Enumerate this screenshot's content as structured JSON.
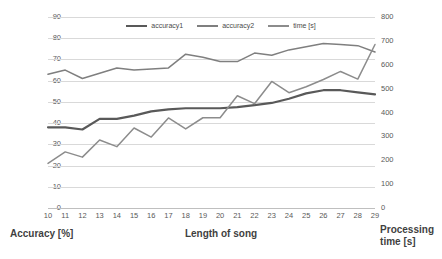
{
  "chart_data": {
    "type": "line",
    "title": "",
    "xlabel": "Length of song",
    "ylabel": "Accuracy [%]",
    "y2label": "Processing time [s]",
    "grid": true,
    "legend_position": "top-center",
    "categories": [
      10,
      11,
      12,
      13,
      14,
      15,
      16,
      17,
      18,
      19,
      20,
      21,
      22,
      23,
      24,
      25,
      26,
      27,
      28,
      29
    ],
    "xtick_labels": [
      "10",
      "11",
      "12",
      "13",
      "14",
      "15",
      "16",
      "17",
      "18",
      "19",
      "20",
      "21",
      "22",
      "23",
      "24",
      "25",
      "26",
      "27",
      "28",
      "29"
    ],
    "ylim": [
      0,
      90
    ],
    "ytick_labels": [
      "0",
      "10",
      "20",
      "30",
      "40",
      "50",
      "60",
      "70",
      "80",
      "90"
    ],
    "ytick_values": [
      0,
      10,
      20,
      30,
      40,
      50,
      60,
      70,
      80,
      90
    ],
    "y2lim": [
      0,
      800
    ],
    "y2tick_labels": [
      "0",
      "100",
      "200",
      "300",
      "400",
      "500",
      "600",
      "700",
      "800"
    ],
    "y2tick_values": [
      0,
      100,
      200,
      300,
      400,
      500,
      600,
      700,
      800
    ],
    "series": [
      {
        "name": "accuracy1",
        "axis": "left",
        "color": "#595959",
        "width": 2.2,
        "values": [
          38.0,
          38.0,
          37.0,
          42.0,
          42.0,
          43.5,
          45.5,
          46.5,
          47.0,
          47.0,
          47.0,
          47.5,
          48.5,
          49.5,
          51.5,
          54.0,
          55.5,
          55.5,
          54.5,
          53.5
        ]
      },
      {
        "name": "accuracy2",
        "axis": "left",
        "color": "#7f7f7f",
        "width": 1.5,
        "values": [
          63.0,
          65.0,
          61.0,
          63.5,
          66.0,
          65.0,
          65.5,
          66.0,
          72.5,
          71.0,
          69.0,
          69.0,
          73.0,
          72.0,
          74.5,
          76.0,
          77.5,
          77.0,
          76.5,
          73.5
        ]
      },
      {
        "name": "time [s]",
        "axis": "right",
        "color": "#8c8c8c",
        "width": 1.5,
        "values": [
          187,
          235,
          213,
          285,
          257,
          335,
          297,
          377,
          331,
          378,
          378,
          470,
          437,
          530,
          483,
          508,
          538,
          572,
          540,
          685
        ]
      }
    ],
    "legend": [
      {
        "label": "accuracy1",
        "color": "#595959"
      },
      {
        "label": "accuracy2",
        "color": "#7f7f7f"
      },
      {
        "label": "time [s]",
        "color": "#8c8c8c"
      }
    ]
  }
}
